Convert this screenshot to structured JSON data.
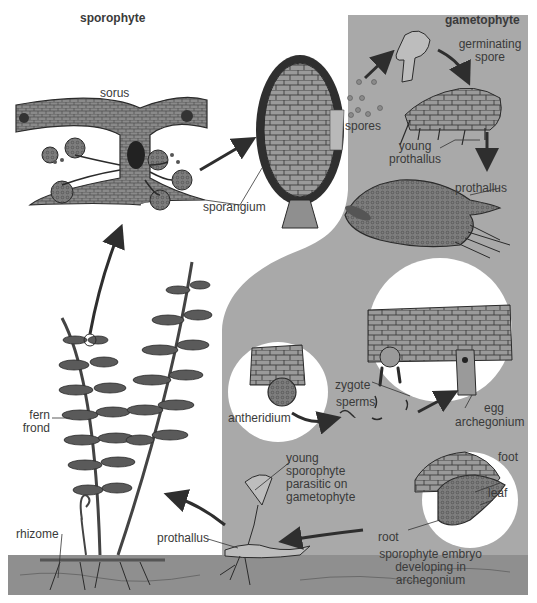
{
  "colors": {
    "background": "#ffffff",
    "gametophyte_region": "#a9a9a9",
    "ground": "#8f8f8f",
    "ink": "#2b2b2b",
    "tissue": "#6f6f6f",
    "arrow": "#2e2e2e"
  },
  "sections": {
    "sporophyte": "sporophyte",
    "gametophyte": "gametophyte"
  },
  "labels": {
    "sorus": "sorus",
    "sporangium": "sporangium",
    "spores": "spores",
    "germinating_spore_1": "germinating",
    "germinating_spore_2": "spore",
    "young_prothallus_1": "young",
    "young_prothallus_2": "prothallus",
    "prothallus_mature": "prothallus",
    "antheridium": "antheridium",
    "zygote": "zygote",
    "sperms": "sperms",
    "egg": "egg",
    "archegonium": "archegonium",
    "foot": "foot",
    "leaf": "leaf",
    "root": "root",
    "embryo_1": "sporophyte embryo",
    "embryo_2": "developing in",
    "embryo_3": "archegonium",
    "young_sporophyte_1": "young",
    "young_sporophyte_2": "sporophyte",
    "young_sporophyte_3": "parasitic on",
    "young_sporophyte_4": "gametophyte",
    "fern_frond_1": "fern",
    "fern_frond_2": "frond",
    "rhizome": "rhizome",
    "prothallus_ground": "prothallus"
  },
  "cycle_stages": [
    "fern frond",
    "sorus",
    "sporangium",
    "spores",
    "germinating spore",
    "young prothallus",
    "prothallus",
    "antheridium",
    "sperms",
    "archegonium",
    "zygote",
    "sporophyte embryo developing in archegonium",
    "young sporophyte parasitic on gametophyte",
    "fern frond"
  ]
}
